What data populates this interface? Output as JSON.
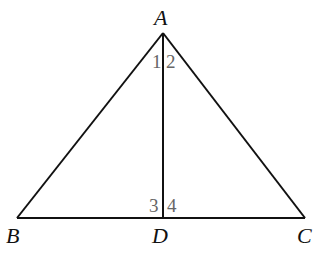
{
  "figure": {
    "type": "triangle-with-altitude",
    "points": {
      "A": {
        "label": "A",
        "x": 163,
        "y": 33
      },
      "B": {
        "label": "B",
        "x": 17,
        "y": 218
      },
      "C": {
        "label": "C",
        "x": 305,
        "y": 218
      },
      "D": {
        "label": "D",
        "x": 163,
        "y": 218
      }
    },
    "segments": [
      "AB",
      "AC",
      "BC",
      "AD"
    ],
    "angle_labels": {
      "angle1": "1",
      "angle2": "2",
      "angle3": "3",
      "angle4": "4"
    },
    "colors": {
      "line": "#111111",
      "angle_label": "#666666"
    }
  }
}
